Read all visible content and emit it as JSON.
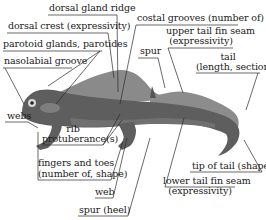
{
  "diagram": {
    "colors": {
      "body_dark": "#5c5c5c",
      "body_mid": "#808080",
      "crest_light": "#8e8e8e",
      "parotoid": "#7a7a7a",
      "leader_line": "#2a2a2a"
    },
    "labels": {
      "dorsal_gland_ridge": "dorsal gland ridge",
      "dorsal_crest": "dorsal crest (expressivity)",
      "parotoid_glands": "parotoid glands, parotides",
      "nasolabial_groove": "nasolabial groove",
      "costal_grooves": "costal grooves (number of)",
      "upper_tail_fin_seam_1": "upper tail fin seam",
      "upper_tail_fin_seam_2": "(expressivity)",
      "spur_top": "spur",
      "tail_1": "tail",
      "tail_2": "(length, section)",
      "webs": "webs",
      "rib_1": "rib",
      "rib_2": "protuberance(s)",
      "fingers_1": "fingers and toes",
      "fingers_2": "(number of, shape)",
      "web": "web",
      "spur_heel": "spur (heel)",
      "tip_of_tail": "tip of tail (shape)",
      "lower_tail_fin_seam_1": "lower tail fin seam",
      "lower_tail_fin_seam_2": "(expressivity)"
    }
  }
}
